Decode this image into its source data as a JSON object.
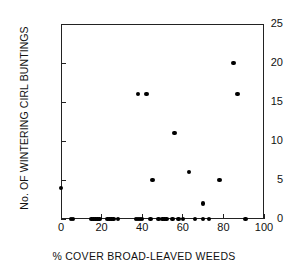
{
  "chart_data": {
    "type": "scatter",
    "title": "",
    "xlabel": "% COVER BROAD-LEAVED WEEDS",
    "ylabel": "No. OF WINTERING CIRL BUNTINGS",
    "xlim": [
      0,
      100
    ],
    "ylim": [
      0,
      25
    ],
    "xticks": [
      0,
      20,
      40,
      60,
      80,
      100
    ],
    "yticks": [
      0,
      5,
      10,
      15,
      20,
      25
    ],
    "xticklabels": [
      "0",
      "20",
      "40",
      "60",
      "80",
      "100"
    ],
    "yticklabels": [
      "0",
      "5",
      "10",
      "15",
      "20",
      "25"
    ],
    "grid": false,
    "legend": null,
    "marker": "filled-circle",
    "marker_color": "#000000",
    "points": [
      {
        "x": 0,
        "y": 4
      },
      {
        "x": 5,
        "y": 0
      },
      {
        "x": 6,
        "y": 0
      },
      {
        "x": 15,
        "y": 0
      },
      {
        "x": 16,
        "y": 0
      },
      {
        "x": 17,
        "y": 0
      },
      {
        "x": 18,
        "y": 0
      },
      {
        "x": 19,
        "y": 0
      },
      {
        "x": 23,
        "y": 0
      },
      {
        "x": 24,
        "y": 0
      },
      {
        "x": 25,
        "y": 0
      },
      {
        "x": 26,
        "y": 0
      },
      {
        "x": 28,
        "y": 0
      },
      {
        "x": 37,
        "y": 0
      },
      {
        "x": 38,
        "y": 16
      },
      {
        "x": 38,
        "y": 0
      },
      {
        "x": 39,
        "y": 0
      },
      {
        "x": 40,
        "y": 0
      },
      {
        "x": 42,
        "y": 16
      },
      {
        "x": 44,
        "y": 0
      },
      {
        "x": 45,
        "y": 5
      },
      {
        "x": 48,
        "y": 0
      },
      {
        "x": 50,
        "y": 0
      },
      {
        "x": 51,
        "y": 0
      },
      {
        "x": 52,
        "y": 0
      },
      {
        "x": 55,
        "y": 0
      },
      {
        "x": 56,
        "y": 11
      },
      {
        "x": 58,
        "y": 0
      },
      {
        "x": 60,
        "y": 0
      },
      {
        "x": 63,
        "y": 6
      },
      {
        "x": 66,
        "y": 0
      },
      {
        "x": 70,
        "y": 2
      },
      {
        "x": 70,
        "y": 0
      },
      {
        "x": 73,
        "y": 0
      },
      {
        "x": 78,
        "y": 5
      },
      {
        "x": 85,
        "y": 20
      },
      {
        "x": 87,
        "y": 16
      },
      {
        "x": 91,
        "y": 0
      }
    ]
  }
}
